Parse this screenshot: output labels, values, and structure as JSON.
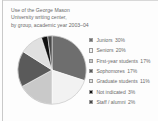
{
  "figure": {
    "caption_lines": [
      "Use of the George Mason",
      "University writing center,",
      "by group, academic year 2003–04"
    ]
  },
  "chart_data": {
    "type": "pie",
    "title": "Use of the George Mason University writing center, by group, academic year 2003–04",
    "xlabel": "",
    "ylabel": "",
    "legend_position": "right",
    "grid": false,
    "categories": [
      "Juniors",
      "Seniors",
      "First-year students",
      "Sophomores",
      "Graduate students",
      "Not indicated",
      "Staff / alumni"
    ],
    "values": [
      30,
      20,
      17,
      17,
      11,
      3,
      2
    ],
    "value_labels": [
      "30%",
      "20%",
      "17%",
      "17%",
      "11%",
      "3%",
      "2%"
    ],
    "colors": [
      "#6e6e6e",
      "#f2f2f2",
      "#c9c9c9",
      "#5a5a5a",
      "#e0e0e0",
      "#111111",
      "#4a4a4a"
    ],
    "slices": [
      {
        "label": "Juniors",
        "value": 30,
        "value_label": "30%",
        "color": "#6e6e6e"
      },
      {
        "label": "Seniors",
        "value": 20,
        "value_label": "20%",
        "color": "#f2f2f2"
      },
      {
        "label": "First-year students",
        "value": 17,
        "value_label": "17%",
        "color": "#c9c9c9"
      },
      {
        "label": "Sophomores",
        "value": 17,
        "value_label": "17%",
        "color": "#5a5a5a"
      },
      {
        "label": "Graduate students",
        "value": 11,
        "value_label": "11%",
        "color": "#e0e0e0"
      },
      {
        "label": "Not indicated",
        "value": 3,
        "value_label": "3%",
        "color": "#111111"
      },
      {
        "label": "Staff / alumni",
        "value": 2,
        "value_label": "2%",
        "color": "#4a4a4a"
      }
    ]
  }
}
